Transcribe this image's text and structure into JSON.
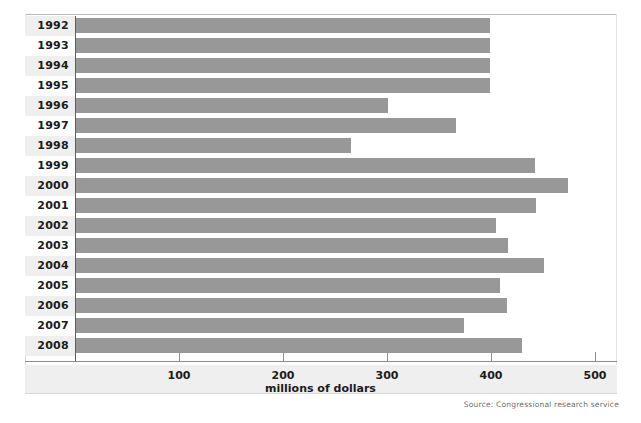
{
  "chart_data": {
    "type": "bar",
    "orientation": "horizontal",
    "title": "",
    "subtitle": "",
    "xlabel": "millions of dollars",
    "ylabel": "",
    "xlim": [
      0,
      520
    ],
    "xticks": [
      100,
      200,
      300,
      400,
      500
    ],
    "grid": false,
    "legend": null,
    "bar_color": "#989898",
    "categories": [
      "1992",
      "1993",
      "1994",
      "1995",
      "1996",
      "1997",
      "1998",
      "1999",
      "2000",
      "2001",
      "2002",
      "2003",
      "2004",
      "2005",
      "2006",
      "2007",
      "2008"
    ],
    "values": [
      399,
      399,
      399,
      399,
      301,
      366,
      265,
      442,
      474,
      443,
      405,
      416,
      451,
      409,
      415,
      374,
      430
    ],
    "source": "Source: Congressional research service"
  },
  "axis": {
    "x_title": "millions of dollars",
    "tick_labels": [
      "100",
      "200",
      "300",
      "400",
      "500"
    ]
  },
  "footer": {
    "source": "Source: Congressional research service"
  }
}
